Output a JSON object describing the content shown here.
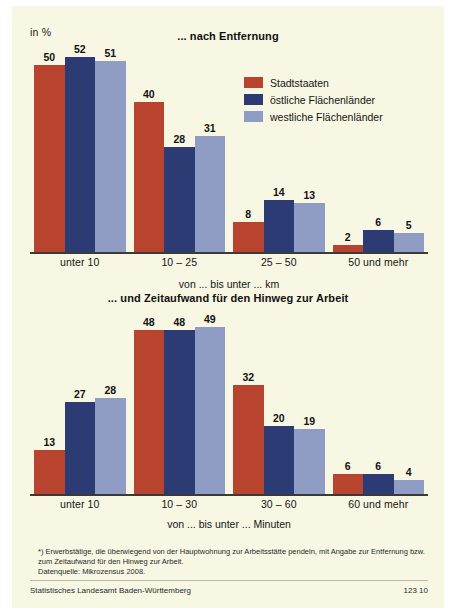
{
  "unit_label": "in %",
  "legend": {
    "items": [
      {
        "label": "Stadtstaaten",
        "color": "#b8432f"
      },
      {
        "label": "östliche Flächenländer",
        "color": "#2c3b73"
      },
      {
        "label": "westliche Flächenländer",
        "color": "#8f9dc4"
      }
    ]
  },
  "footnote": "*) Erwerbstätige, die überwiegend von der Hauptwohnung zur Arbeitsstätte pendeln, mit Angabe zur Entfernung bzw. zum Zeitaufwand für den Hinweg zur Arbeit.\nDatenquelle: Mikrozensus 2008.",
  "footer": {
    "source": "Statistisches Landesamt Baden-Württemberg",
    "number": "123 10"
  },
  "chart_data": [
    {
      "type": "bar",
      "title": "... nach Entfernung",
      "xlabel": "von ... bis unter ... km",
      "ylabel": "in %",
      "ylim": [
        0,
        55
      ],
      "grid": false,
      "legend_position": "top-right",
      "categories": [
        "unter 10",
        "10 – 25",
        "25 – 50",
        "50 und mehr"
      ],
      "series": [
        {
          "name": "Stadtstaaten",
          "color": "#b8432f",
          "values": [
            50,
            40,
            8,
            2
          ]
        },
        {
          "name": "östliche Flächenländer",
          "color": "#2c3b73",
          "values": [
            52,
            28,
            14,
            6
          ]
        },
        {
          "name": "westliche Flächenländer",
          "color": "#8f9dc4",
          "values": [
            51,
            31,
            13,
            5
          ]
        }
      ]
    },
    {
      "type": "bar",
      "title": "... und Zeitaufwand für den Hinweg zur Arbeit",
      "xlabel": "von ... bis unter ... Minuten",
      "ylabel": "in %",
      "ylim": [
        0,
        55
      ],
      "grid": false,
      "legend_position": "none",
      "categories": [
        "unter 10",
        "10 – 30",
        "30 – 60",
        "60 und mehr"
      ],
      "series": [
        {
          "name": "Stadtstaaten",
          "color": "#b8432f",
          "values": [
            13,
            48,
            32,
            6
          ]
        },
        {
          "name": "östliche Flächenländer",
          "color": "#2c3b73",
          "values": [
            27,
            48,
            20,
            6
          ]
        },
        {
          "name": "westliche Flächenländer",
          "color": "#8f9dc4",
          "values": [
            28,
            49,
            19,
            4
          ]
        }
      ]
    }
  ]
}
